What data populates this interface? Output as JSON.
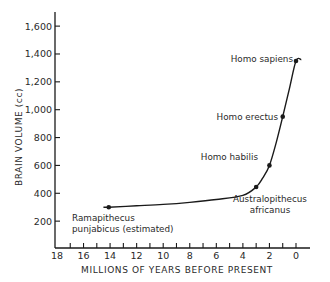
{
  "chart_data": {
    "type": "line",
    "title": "",
    "xlabel": "MILLIONS OF YEARS BEFORE PRESENT",
    "ylabel": "BRAIN VOLUME (cc)",
    "xlim": [
      18,
      0
    ],
    "ylim": [
      0,
      1700
    ],
    "x_ticks": [
      18,
      16,
      14,
      12,
      10,
      8,
      6,
      4,
      2,
      0
    ],
    "x_tick_labels": [
      "18",
      "16",
      "14",
      "12",
      "10",
      "8",
      "6",
      "4",
      "2",
      "0"
    ],
    "x_minor_tick_step": 1,
    "y_ticks": [
      200,
      400,
      600,
      800,
      1000,
      1200,
      1400,
      1600
    ],
    "y_tick_labels": [
      "200",
      "400",
      "600",
      "800",
      "1,000",
      "1,200",
      "1,400",
      "1,600"
    ],
    "grid": false,
    "legend": null,
    "series": [
      {
        "name": "Brain volume",
        "x": [
          14.5,
          14.1,
          12,
          10,
          8,
          6,
          4,
          3.0,
          2.5,
          2.0,
          1.5,
          1.0,
          0.5,
          0.0,
          -0.4
        ],
        "values": [
          300,
          300,
          310,
          320,
          335,
          355,
          385,
          445,
          510,
          600,
          760,
          950,
          1150,
          1350,
          1360
        ]
      }
    ],
    "points": [
      {
        "label": "Ramapithecus punjabicus (estimated)",
        "x": 14.1,
        "y": 300
      },
      {
        "label": "Australopithecus africanus",
        "x": 3.0,
        "y": 445
      },
      {
        "label": "Homo habilis",
        "x": 2.0,
        "y": 600
      },
      {
        "label": "Homo erectus",
        "x": 1.0,
        "y": 950
      },
      {
        "label": "Homo sapiens",
        "x": 0.0,
        "y": 1350
      }
    ],
    "annotations": [
      {
        "lines": [
          "Ramapithecus",
          "punjabicus (estimated)"
        ]
      },
      {
        "lines": [
          "Australopithecus",
          "africanus"
        ]
      },
      {
        "lines": [
          "Homo habilis"
        ]
      },
      {
        "lines": [
          "Homo erectus"
        ]
      },
      {
        "lines": [
          "Homo sapiens"
        ]
      }
    ],
    "colors": {
      "line": "#1a1a1a",
      "text": "#2a2a2a",
      "background": "#ffffff"
    }
  }
}
